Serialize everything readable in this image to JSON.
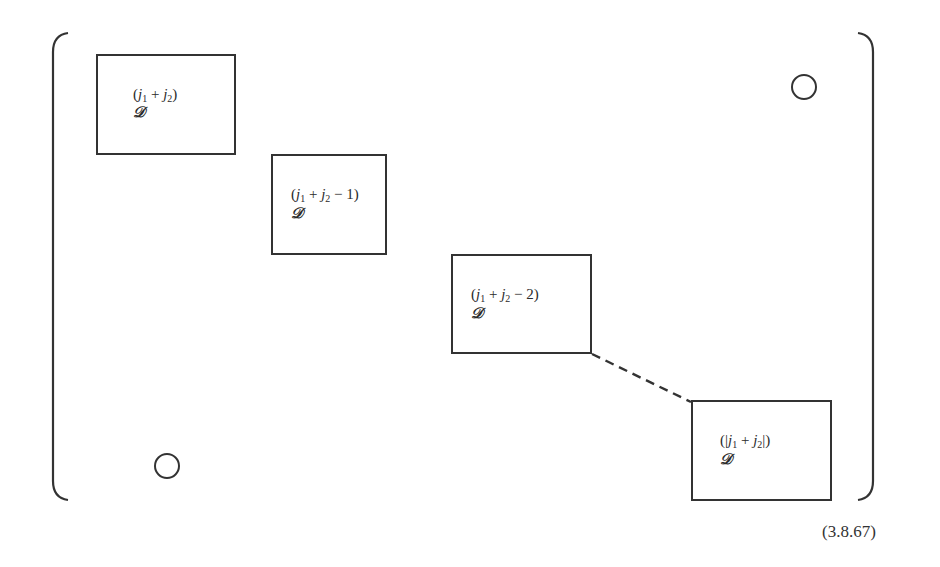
{
  "diagram": {
    "type": "block-diagonal-matrix",
    "blocks": [
      {
        "id": "block-1",
        "label_open": "(",
        "label_parts": [
          "j",
          "1",
          " + ",
          "j",
          "2",
          ")"
        ],
        "label_text": "(j1 + j2)",
        "symbol": "𝒟",
        "box": {
          "x": 96,
          "y": 54,
          "w": 140,
          "h": 101
        }
      },
      {
        "id": "block-2",
        "label_text": "(j1 + j2 − 1)",
        "label_parts": [
          "(",
          "j",
          "1",
          " + ",
          "j",
          "2",
          " − 1)"
        ],
        "symbol": "𝒟",
        "box": {
          "x": 271,
          "y": 154,
          "w": 116,
          "h": 101
        }
      },
      {
        "id": "block-3",
        "label_text": "(j1 + j2 − 2)",
        "label_parts": [
          "(",
          "j",
          "1",
          " + ",
          "j",
          "2",
          " − 2)"
        ],
        "symbol": "𝒟",
        "box": {
          "x": 451,
          "y": 254,
          "w": 141,
          "h": 100
        }
      },
      {
        "id": "block-4",
        "label_text": "(|j1 + j2|)",
        "label_parts": [
          "(|",
          "j",
          "1",
          " + ",
          "j",
          "2",
          "|)"
        ],
        "symbol": "𝒟",
        "box": {
          "x": 691,
          "y": 400,
          "w": 141,
          "h": 101
        }
      }
    ],
    "zero_markers": [
      {
        "id": "upper-right-zero",
        "cx": 804,
        "cy": 87,
        "r": 12
      },
      {
        "id": "lower-left-zero",
        "cx": 167,
        "cy": 466,
        "r": 12
      }
    ],
    "ellipsis_connector": {
      "style": "dashed",
      "from": [
        592,
        354
      ],
      "to": [
        691,
        402
      ]
    },
    "equation_number": "(3.8.67)"
  }
}
